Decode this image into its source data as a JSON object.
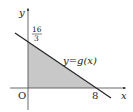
{
  "diagram": {
    "type": "function-graph",
    "axes": {
      "x_label": "x",
      "y_label": "y",
      "origin_label": "O"
    },
    "line": {
      "label": "y=g(x)",
      "y_intercept_label_num": "16",
      "y_intercept_label_den": "3",
      "x_intercept_label": "8",
      "color": "#222222"
    },
    "shaded_region": {
      "description": "triangle under y=g(x) in first quadrant",
      "fill": "#c8c8c8"
    }
  }
}
